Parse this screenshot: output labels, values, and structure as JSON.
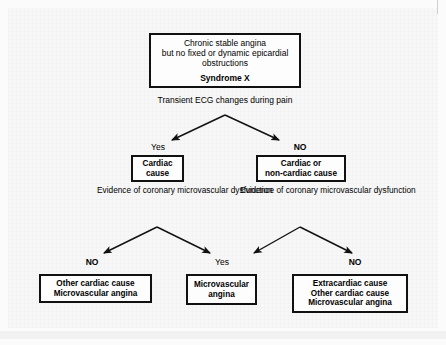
{
  "diagram": {
    "title_node": {
      "lines": [
        "Chronic stable angina",
        "but no fixed or dynamic epicardial",
        "obstructions"
      ],
      "emphasis": "Syndrome X"
    },
    "criterion_1": "Transient ECG changes during pain",
    "branch_1": {
      "left_label": "Yes",
      "right_label": "NO"
    },
    "node_left": {
      "line1": "Cardiac",
      "line2": "cause"
    },
    "node_right": {
      "line1": "Cardiac or",
      "line2": "non-cardiac cause"
    },
    "criterion_2_left": {
      "line1": "Evidence of",
      "line2": "coronary microvascular",
      "line3": "dysfunction"
    },
    "criterion_2_right": {
      "line1": "Evidence of",
      "line2": "coronary microvascular",
      "line3": "dysfunction"
    },
    "branch_2": {
      "left_left_label": "NO",
      "left_right_label": "Yes",
      "right_left_label": "Yes",
      "right_right_label": "NO"
    },
    "outcome_left": {
      "line1": "Other cardiac cause",
      "line2": "Microvascular angina"
    },
    "outcome_middle": {
      "line1": "Microvascular",
      "line2": "angina"
    },
    "outcome_right": {
      "line1": "Extracardiac cause",
      "line2": "Other cardiac cause",
      "line3": "Microvascular angina"
    },
    "colors": {
      "ink": "#111111",
      "paper": "#f7f7f7",
      "node_fill": "#fdfdfd"
    }
  }
}
